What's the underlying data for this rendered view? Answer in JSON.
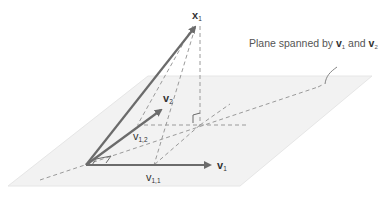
{
  "diagram": {
    "type": "vector projection onto plane",
    "caption": {
      "prefix": "Plane spanned by ",
      "v1": "v",
      "v1_sub": "1",
      "mid": " and ",
      "v2": "v",
      "v2_sub": "2"
    },
    "labels": {
      "x1": {
        "base": "x",
        "sub": "1"
      },
      "v1": {
        "base": "v",
        "sub": "1"
      },
      "v2": {
        "base": "v",
        "sub": "2"
      },
      "v11": {
        "base": "v",
        "sub": "1,1"
      },
      "v12": {
        "base": "v",
        "sub": "1,2"
      }
    },
    "colors": {
      "plane_fill": "#f2f2f2",
      "plane_edge": "#e6e6e6",
      "vector": "#6b6b6b",
      "dashed": "#9a9a9a",
      "text": "#333333"
    },
    "geometry": {
      "origin": [
        86,
        165
      ],
      "x1_tip": [
        197,
        24
      ],
      "v1_tip": [
        212,
        165
      ],
      "v2_tip": [
        163,
        108
      ],
      "v11_point": [
        154,
        165
      ],
      "v12_point": [
        137,
        125
      ],
      "projection_point": [
        200,
        125
      ]
    }
  }
}
